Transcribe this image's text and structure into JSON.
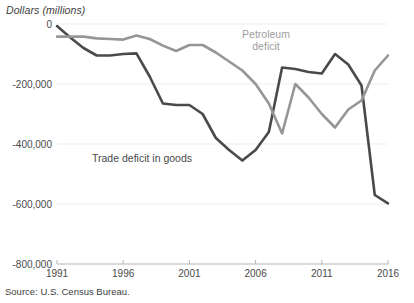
{
  "chart_data": {
    "type": "line",
    "title": "",
    "ylabel": "Dollars (millions)",
    "xlabel": "",
    "grid": true,
    "legend_position": "inline-annotations",
    "xlim": [
      1991,
      2016
    ],
    "ylim": [
      -800000,
      0
    ],
    "ytick_labels": [
      "0",
      "-200,000",
      "-400,000",
      "-600,000",
      "-800,000"
    ],
    "ytick_values": [
      0,
      -200000,
      -400000,
      -600000,
      -800000
    ],
    "xtick_labels": [
      "1991",
      "1996",
      "2001",
      "2006",
      "2011",
      "2016"
    ],
    "xtick_values": [
      1991,
      1996,
      2001,
      2006,
      2011,
      2016
    ],
    "x": [
      1991,
      1992,
      1993,
      1994,
      1995,
      1996,
      1997,
      1998,
      1999,
      2000,
      2001,
      2002,
      2003,
      2004,
      2005,
      2006,
      2007,
      2008,
      2009,
      2010,
      2011,
      2012,
      2013,
      2014,
      2015,
      2016
    ],
    "series": [
      {
        "name": "Trade deficit in goods",
        "color": "#4a4a4a",
        "values": [
          -7000,
          -45000,
          -80000,
          -105000,
          -105000,
          -100000,
          -98000,
          -175000,
          -265000,
          -270000,
          -270000,
          -300000,
          -380000,
          -420000,
          -455000,
          -420000,
          -360000,
          -145000,
          -150000,
          -160000,
          -165000,
          -100000,
          -135000,
          -205000,
          -570000,
          -598000
        ]
      },
      {
        "name": "Petroleum deficit",
        "color": "#969696",
        "values": [
          -42000,
          -42000,
          -42000,
          -48000,
          -50000,
          -52000,
          -38000,
          -50000,
          -72000,
          -90000,
          -70000,
          -70000,
          -95000,
          -125000,
          -155000,
          -200000,
          -265000,
          -365000,
          -200000,
          -245000,
          -300000,
          -345000,
          -285000,
          -255000,
          -155000,
          -105000
        ]
      }
    ],
    "annotations": [
      {
        "name": "petroleum-label",
        "text_line1": "Petroleum",
        "text_line2": "deficit"
      },
      {
        "name": "trade-label",
        "text": "Trade deficit in goods"
      }
    ],
    "source": "Source: U.S. Census Bureau."
  },
  "axis": {
    "y_title": "Dollars (millions)"
  },
  "labels": {
    "petroleum_line1": "Petroleum",
    "petroleum_line2": "deficit",
    "trade": "Trade deficit in goods"
  },
  "footer": {
    "source": "Source: U.S. Census Bureau."
  }
}
